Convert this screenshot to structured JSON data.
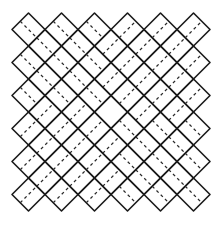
{
  "canvas": {
    "width": 219,
    "height": 227,
    "background": "#ffffff"
  },
  "pattern": {
    "description": "Diamond lattice of solid lines with dashed midlines forming concentric diamond rings",
    "line_color": "#1a1a1a",
    "dash_color": "#2a2a2a",
    "primary_grid": {
      "origin_x": 28.5,
      "origin_y": 29.5,
      "step": 33,
      "count_x": 6,
      "count_y": 6
    },
    "secondary_grid": {
      "origin_x": 45,
      "origin_y": 46,
      "step": 33,
      "count_x": 5,
      "count_y": 5
    },
    "half_diagonal": 16.5,
    "center": {
      "x": 111,
      "y": 112
    }
  }
}
